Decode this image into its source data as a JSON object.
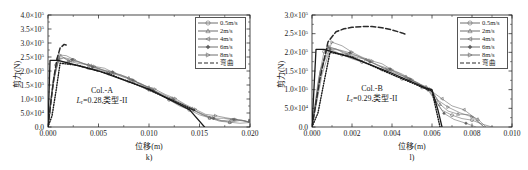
{
  "figure": {
    "panels": [
      {
        "id": "panel-k",
        "subcaption": "k)",
        "xlabel": "位移(m)",
        "ylabel": "剪力(N)",
        "annotation_line1": "Col.-A",
        "annotation_line2_pre": "L",
        "annotation_line2_sub": "r",
        "annotation_line2_post": "=0.28,类型-II",
        "xticks": [
          "0.000",
          "0.005",
          "0.010",
          "0.015",
          "0.020"
        ],
        "yticks": [
          "0.0",
          "5.0×10⁴",
          "1.0×10⁵",
          "1.5×10⁵",
          "2.0×10⁵",
          "2.5×10⁵",
          "3.0×10⁵",
          "3.5×10⁵",
          "4.0×10⁵"
        ]
      },
      {
        "id": "panel-l",
        "subcaption": "l)",
        "xlabel": "位移(m)",
        "ylabel": "剪力(N)",
        "annotation_line1": "Col.-B",
        "annotation_line2_pre": "L",
        "annotation_line2_sub": "r",
        "annotation_line2_post": "=0.29,类型-II",
        "xticks": [
          "0.000",
          "0.002",
          "0.004",
          "0.006",
          "0.008",
          "0.010"
        ],
        "yticks": [
          "0.0",
          "5.0×10⁴",
          "1.0×10⁵",
          "1.5×10⁵",
          "2.0×10⁵",
          "2.5×10⁵",
          "3.0×10⁵"
        ]
      }
    ],
    "legend": {
      "entries": [
        {
          "label": "0.5m/s",
          "marker": "circle",
          "style": "solid"
        },
        {
          "label": "2m/s",
          "marker": "triangle-up",
          "style": "solid"
        },
        {
          "label": "4m/s",
          "marker": "triangle-left",
          "style": "solid"
        },
        {
          "label": "6m/s",
          "marker": "diamond-filled",
          "style": "solid"
        },
        {
          "label": "8m/s",
          "marker": "triangle-right",
          "style": "solid"
        },
        {
          "label": "弯曲",
          "marker": "none",
          "style": "dashed"
        }
      ]
    },
    "colors": {
      "axis": "#1a1a1a",
      "curve": "#555555",
      "curve_light": "#8a8a8a",
      "bending": "#333333"
    }
  },
  "chart_data": [
    {
      "type": "line",
      "id": "k",
      "title": "Col.-A",
      "subcaption": "k)",
      "xlabel": "位移(m)",
      "ylabel": "剪力(N)",
      "xlim": [
        0.0,
        0.02
      ],
      "ylim": [
        0.0,
        400000
      ],
      "xticks": [
        0.0,
        0.005,
        0.01,
        0.015,
        0.02
      ],
      "yticks": [
        0,
        50000,
        100000,
        150000,
        200000,
        250000,
        300000,
        350000,
        400000
      ],
      "grid": false,
      "legend_position": "top-right",
      "annotations": [
        "Col.-A",
        "Lr=0.28,类型-II"
      ],
      "series": [
        {
          "name": "0.5m/s",
          "marker": "circle",
          "x": [
            0.0,
            0.0004,
            0.0008,
            0.0012,
            0.002,
            0.003,
            0.004,
            0.005,
            0.006,
            0.007,
            0.008,
            0.009,
            0.01,
            0.011,
            0.012,
            0.013,
            0.014,
            0.015,
            0.016,
            0.017,
            0.018,
            0.019,
            0.02
          ],
          "y": [
            0,
            130000,
            225000,
            238000,
            232000,
            222000,
            212000,
            200000,
            188000,
            175000,
            162000,
            148000,
            133000,
            117000,
            100000,
            82000,
            64000,
            48000,
            35000,
            26000,
            21000,
            18000,
            16000
          ]
        },
        {
          "name": "2m/s",
          "marker": "triangle-up",
          "x": [
            0.0,
            0.0005,
            0.001,
            0.0014,
            0.002,
            0.003,
            0.004,
            0.005,
            0.006,
            0.007,
            0.008,
            0.009,
            0.01,
            0.011,
            0.012,
            0.013,
            0.014,
            0.015,
            0.016,
            0.017,
            0.018,
            0.019,
            0.02
          ],
          "y": [
            0,
            165000,
            250000,
            255000,
            240000,
            228000,
            218000,
            207000,
            195000,
            183000,
            170000,
            156000,
            141000,
            124000,
            107000,
            89000,
            70000,
            52000,
            38000,
            28000,
            22000,
            19000,
            17000
          ]
        },
        {
          "name": "4m/s",
          "marker": "triangle-left",
          "x": [
            0.0,
            0.0005,
            0.001,
            0.0015,
            0.0022,
            0.0032,
            0.0042,
            0.0052,
            0.0062,
            0.0072,
            0.0082,
            0.0092,
            0.0102,
            0.0112,
            0.0122,
            0.0132,
            0.0142,
            0.0152,
            0.0162,
            0.0172,
            0.0182,
            0.0192,
            0.02
          ],
          "y": [
            0,
            158000,
            245000,
            252000,
            238000,
            226000,
            216000,
            205000,
            193000,
            181000,
            168000,
            154000,
            139000,
            122000,
            105000,
            87000,
            68000,
            50000,
            37000,
            27000,
            22000,
            18000,
            16000
          ]
        },
        {
          "name": "6m/s",
          "marker": "diamond-filled",
          "x": [
            0.0,
            0.0005,
            0.001,
            0.0016,
            0.0024,
            0.0034,
            0.0044,
            0.0054,
            0.0064,
            0.0074,
            0.0084,
            0.0094,
            0.0104,
            0.0114,
            0.0124,
            0.0134,
            0.0144,
            0.0154,
            0.0164,
            0.0174,
            0.0184,
            0.0194,
            0.02
          ],
          "y": [
            0,
            150000,
            243000,
            249000,
            236000,
            224000,
            214000,
            203000,
            191000,
            179000,
            166000,
            152000,
            137000,
            120000,
            103000,
            85000,
            66000,
            49000,
            36000,
            27000,
            21000,
            18000,
            16000
          ]
        },
        {
          "name": "8m/s",
          "marker": "triangle-right",
          "x": [
            0.0,
            0.0006,
            0.0012,
            0.0018,
            0.0026,
            0.0036,
            0.0046,
            0.0056,
            0.0066,
            0.0076,
            0.0086,
            0.0096,
            0.0106,
            0.0116,
            0.0126,
            0.0136,
            0.0146,
            0.0156,
            0.0166,
            0.0176,
            0.0186,
            0.0196,
            0.02
          ],
          "y": [
            0,
            175000,
            258000,
            250000,
            237000,
            225000,
            215000,
            204000,
            192000,
            180000,
            167000,
            153000,
            138000,
            121000,
            104000,
            86000,
            67000,
            50000,
            36000,
            27000,
            22000,
            18000,
            16000
          ]
        },
        {
          "name": "弯曲",
          "marker": "none",
          "style": "dashed",
          "x": [
            0.0,
            0.0003,
            0.0006,
            0.0009,
            0.0012,
            0.0016,
            0.002
          ],
          "y": [
            0,
            95000,
            180000,
            245000,
            282000,
            295000,
            290000
          ]
        },
        {
          "name": "理论斜线",
          "marker": "none",
          "style": "solid-thick",
          "x": [
            0.0,
            0.0002,
            0.001,
            0.005,
            0.01,
            0.014,
            0.0155
          ],
          "y": [
            0,
            238000,
            238000,
            200000,
            135000,
            62000,
            0
          ]
        },
        {
          "name": "点线",
          "marker": "none",
          "style": "dotted",
          "x": [
            0.0,
            0.0004,
            0.0008,
            0.0012,
            0.003,
            0.006,
            0.009,
            0.012,
            0.0145
          ],
          "y": [
            0,
            40000,
            130000,
            228000,
            220000,
            190000,
            148000,
            100000,
            60000
          ]
        }
      ]
    },
    {
      "type": "line",
      "id": "l",
      "title": "Col.-B",
      "subcaption": "l)",
      "xlabel": "位移(m)",
      "ylabel": "剪力(N)",
      "xlim": [
        0.0,
        0.01
      ],
      "ylim": [
        0.0,
        300000
      ],
      "xticks": [
        0.0,
        0.002,
        0.004,
        0.006,
        0.008,
        0.01
      ],
      "yticks": [
        0,
        50000,
        100000,
        150000,
        200000,
        250000,
        300000
      ],
      "grid": false,
      "legend_position": "top-right",
      "annotations": [
        "Col.-B",
        "Lr=0.29,类型-II"
      ],
      "series": [
        {
          "name": "0.5m/s",
          "marker": "circle",
          "x": [
            0.0,
            0.0003,
            0.0006,
            0.001,
            0.0015,
            0.002,
            0.0025,
            0.003,
            0.0035,
            0.004,
            0.0045,
            0.005,
            0.0055,
            0.0058,
            0.0062,
            0.0065,
            0.007,
            0.0075,
            0.008,
            0.0085,
            0.009
          ],
          "y": [
            0,
            120000,
            205000,
            208000,
            196000,
            186000,
            175000,
            163000,
            152000,
            140000,
            128000,
            116000,
            106000,
            102000,
            72000,
            50000,
            34000,
            26000,
            20000,
            12000,
            0
          ]
        },
        {
          "name": "2m/s",
          "marker": "triangle-up",
          "x": [
            0.0,
            0.0004,
            0.0008,
            0.0012,
            0.0017,
            0.0022,
            0.0027,
            0.0032,
            0.0037,
            0.0042,
            0.0047,
            0.0052,
            0.0057,
            0.006,
            0.0064,
            0.0068,
            0.0073,
            0.0078,
            0.0083,
            0.0087
          ],
          "y": [
            0,
            150000,
            215000,
            212000,
            198000,
            188000,
            177000,
            166000,
            154000,
            142000,
            131000,
            119000,
            107000,
            100000,
            66000,
            45000,
            38000,
            35000,
            25000,
            0
          ]
        },
        {
          "name": "4m/s",
          "marker": "triangle-left",
          "x": [
            0.0,
            0.0004,
            0.0008,
            0.0013,
            0.0018,
            0.0023,
            0.0028,
            0.0033,
            0.0038,
            0.0043,
            0.0048,
            0.0053,
            0.0057,
            0.006,
            0.0065,
            0.007,
            0.0076,
            0.0081,
            0.0086
          ],
          "y": [
            0,
            145000,
            218000,
            210000,
            197000,
            186000,
            176000,
            164000,
            153000,
            141000,
            129000,
            117000,
            106000,
            100000,
            78000,
            60000,
            48000,
            30000,
            0
          ]
        },
        {
          "name": "6m/s",
          "marker": "diamond-filled",
          "x": [
            0.0,
            0.0005,
            0.0009,
            0.0014,
            0.0019,
            0.0024,
            0.0029,
            0.0034,
            0.0039,
            0.0044,
            0.0049,
            0.0054,
            0.0058,
            0.0062,
            0.0066,
            0.0071,
            0.0077,
            0.0082
          ],
          "y": [
            0,
            140000,
            212000,
            207000,
            195000,
            185000,
            174000,
            163000,
            151000,
            139000,
            127000,
            115000,
            104000,
            70000,
            40000,
            22000,
            14000,
            0
          ]
        },
        {
          "name": "8m/s",
          "marker": "triangle-right",
          "x": [
            0.0,
            0.0005,
            0.001,
            0.0015,
            0.002,
            0.0025,
            0.003,
            0.0035,
            0.004,
            0.0045,
            0.005,
            0.0055,
            0.0059,
            0.0063,
            0.0068,
            0.0074,
            0.008,
            0.0086
          ],
          "y": [
            0,
            160000,
            228000,
            214000,
            198000,
            187000,
            176000,
            165000,
            153000,
            141000,
            129000,
            117000,
            104000,
            75000,
            55000,
            42000,
            30000,
            0
          ]
        },
        {
          "name": "弯曲",
          "marker": "none",
          "style": "dashed",
          "x": [
            0.0,
            0.0004,
            0.0008,
            0.0012,
            0.0016,
            0.002,
            0.0025,
            0.003,
            0.0035,
            0.004,
            0.0045,
            0.0047
          ],
          "y": [
            0,
            130000,
            228000,
            255000,
            263000,
            267000,
            269000,
            269000,
            266000,
            260000,
            252000,
            248000
          ]
        },
        {
          "name": "理论斜线",
          "marker": "none",
          "style": "solid-thick",
          "x": [
            0.0,
            0.0002,
            0.0006,
            0.002,
            0.004,
            0.0057,
            0.006,
            0.0063,
            0.0065
          ],
          "y": [
            0,
            208000,
            208000,
            186000,
            144000,
            104000,
            100000,
            45000,
            0
          ]
        },
        {
          "name": "点线",
          "marker": "none",
          "style": "dotted",
          "x": [
            0.0,
            0.0003,
            0.0006,
            0.0009,
            0.002,
            0.0035,
            0.005,
            0.0057,
            0.006,
            0.0064
          ],
          "y": [
            0,
            38000,
            120000,
            200000,
            188000,
            152000,
            118000,
            102000,
            96000,
            0
          ]
        }
      ]
    }
  ]
}
